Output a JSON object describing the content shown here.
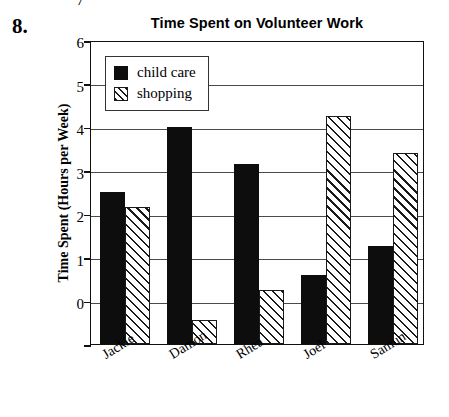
{
  "question_number": "8.",
  "chart_data": {
    "type": "bar",
    "title": "Time Spent on Volunteer Work",
    "xlabel": "",
    "ylabel": "Time Spent (Hours per Week)",
    "categories": [
      "Jackie",
      "Damon",
      "Rhea",
      "Joel",
      "Samun"
    ],
    "series": [
      {
        "name": "child care",
        "pattern": "solid",
        "values": [
          3.5,
          5.0,
          4.15,
          1.6,
          2.25
        ]
      },
      {
        "name": "shopping",
        "pattern": "hatch",
        "values": [
          3.15,
          0.55,
          1.25,
          5.25,
          4.4
        ]
      }
    ],
    "ylim": [
      0,
      7
    ],
    "y_ticks": [
      "0",
      "1",
      "2",
      "3",
      "4",
      "5",
      "6",
      "7"
    ],
    "grid": true,
    "legend_position": "upper-left-inside",
    "x_tick_rotation": -32
  }
}
